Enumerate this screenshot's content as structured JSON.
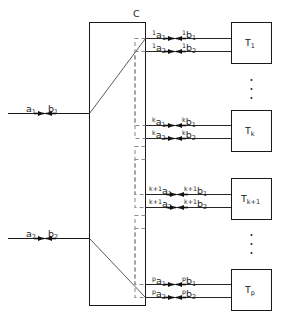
{
  "figure": {
    "kind": "block-diagram",
    "central_block": {
      "label": "C",
      "name": "central-controller-block"
    },
    "inputs": [
      {
        "id": "in1",
        "a": "a",
        "a_sub": "1",
        "b": "b",
        "b_sub": "1",
        "marker": "bidirectional-arrow-marker"
      },
      {
        "id": "in2",
        "a": "a",
        "a_sub": "2",
        "b": "b",
        "b_sub": "2",
        "marker": "bidirectional-arrow-marker"
      }
    ],
    "channels": [
      {
        "index": "1",
        "block_label": "T",
        "block_sub": "1",
        "lines": [
          {
            "a": "a",
            "a_sub": "1",
            "a_sup": "1",
            "b": "b",
            "b_sub": "1",
            "b_sup": "1"
          },
          {
            "a": "a",
            "a_sub": "2",
            "a_sup": "1",
            "b": "b",
            "b_sub": "2",
            "b_sup": "1"
          }
        ]
      },
      {
        "index": "k",
        "block_label": "T",
        "block_sub": "k",
        "lines": [
          {
            "a": "a",
            "a_sub": "1",
            "a_sup": "k",
            "b": "b",
            "b_sub": "1",
            "b_sup": "k"
          },
          {
            "a": "a",
            "a_sub": "2",
            "a_sup": "k",
            "b": "b",
            "b_sub": "2",
            "b_sup": "k"
          }
        ]
      },
      {
        "index": "k+1",
        "block_label": "T",
        "block_sub": "k+1",
        "lines": [
          {
            "a": "a",
            "a_sub": "1",
            "a_sup": "k+1",
            "b": "b",
            "b_sub": "1",
            "b_sup": "k+1"
          },
          {
            "a": "a",
            "a_sub": "2",
            "a_sup": "k+1",
            "b": "b",
            "b_sub": "2",
            "b_sup": "k+1"
          }
        ]
      },
      {
        "index": "p",
        "block_label": "T",
        "block_sub": "p",
        "lines": [
          {
            "a": "a",
            "a_sub": "1",
            "a_sup": "p",
            "b": "b",
            "b_sub": "1",
            "b_sup": "p"
          },
          {
            "a": "a",
            "a_sub": "2",
            "a_sup": "p",
            "b": "b",
            "b_sub": "2",
            "b_sup": "p"
          }
        ]
      }
    ],
    "ellipses": [
      {
        "id": "ellipsis-upper",
        "glyph": "·",
        "count": 3
      },
      {
        "id": "ellipsis-lower",
        "glyph": "·",
        "count": 3
      }
    ],
    "colors": {
      "stroke": "#1a1a1a",
      "dashed_stroke": "#8c8c8c",
      "background": "#ffffff",
      "marker_fill": "#111111"
    }
  }
}
